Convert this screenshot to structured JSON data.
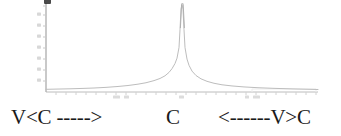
{
  "figure": {
    "background_color": "#ffffff",
    "caption": {
      "left_label": "V<C ----->",
      "center_label": "C",
      "right_label": "<------V>C",
      "text_color": "#1a1a1a"
    },
    "axes": {
      "axis_color": "#b9b9b9",
      "y_axis_x": 46,
      "x_axis_y": 92,
      "x_axis_start": 46,
      "x_axis_end": 318,
      "y_axis_top": 3,
      "y_tick_count": 8,
      "x_tick_count": 27,
      "top_smudge": "clipped-tick-label"
    }
  },
  "chart_data": {
    "type": "line",
    "title": "",
    "subtitle": "",
    "xlabel": "",
    "ylabel": "",
    "legend": [],
    "grid": false,
    "legend_position": "none",
    "line_color": "#bdbdbd",
    "peak_color": "#9a9a9a",
    "xlim": [
      0,
      340
    ],
    "ylim": [
      0,
      1
    ],
    "annotations": [
      {
        "text": "V<C ----->",
        "position": "below-left"
      },
      {
        "text": "C",
        "position": "below-center"
      },
      {
        "text": "<------V>C",
        "position": "below-right"
      }
    ],
    "peak_center_x": 182,
    "peak_half_width": 6,
    "x": [
      46,
      58,
      70,
      82,
      94,
      106,
      118,
      128,
      138,
      146,
      154,
      160,
      165,
      169,
      172,
      175,
      177,
      179,
      180,
      181,
      182,
      183,
      184,
      185,
      187,
      189,
      192,
      196,
      201,
      207,
      214,
      222,
      232,
      244,
      258,
      274,
      292,
      318
    ],
    "y": [
      0.03,
      0.033,
      0.036,
      0.04,
      0.045,
      0.052,
      0.062,
      0.073,
      0.088,
      0.104,
      0.128,
      0.152,
      0.182,
      0.22,
      0.262,
      0.32,
      0.38,
      0.5,
      0.7,
      0.93,
      0.985,
      0.93,
      0.7,
      0.5,
      0.37,
      0.3,
      0.235,
      0.185,
      0.148,
      0.12,
      0.098,
      0.081,
      0.068,
      0.057,
      0.048,
      0.041,
      0.035,
      0.028
    ]
  }
}
